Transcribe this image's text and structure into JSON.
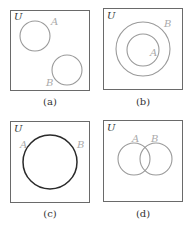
{
  "diagrams": [
    {
      "id": "a",
      "caption": "(a)",
      "universe": "U",
      "set_a": "A",
      "set_b": "B",
      "relation": "disjoint"
    },
    {
      "id": "b",
      "caption": "(b)",
      "universe": "U",
      "set_a": "A",
      "set_b": "B",
      "relation": "A subset of B"
    },
    {
      "id": "c",
      "caption": "(c)",
      "universe": "U",
      "set_a": "A",
      "set_b": "B",
      "relation": "A equals B"
    },
    {
      "id": "d",
      "caption": "(d)",
      "universe": "U",
      "set_a": "A",
      "set_b": "B",
      "relation": "overlapping"
    }
  ],
  "colors": {
    "box": "#6a6a6a",
    "circle": "#9a9a9a",
    "circle_equal": "#2a2a2a",
    "set_label": "#aaaaaa",
    "text": "#333333"
  }
}
